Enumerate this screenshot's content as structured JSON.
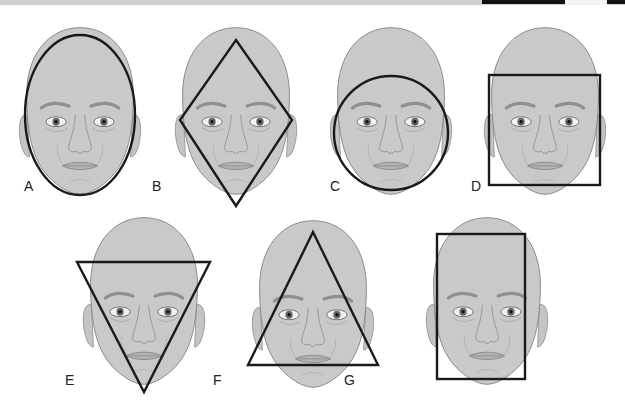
{
  "figure": {
    "background": "#ffffff",
    "skin_color": "#c9c9c9",
    "outline_color": "#1a1a1a",
    "panels": [
      {
        "label": "A",
        "shape": "oval"
      },
      {
        "label": "B",
        "shape": "diamond"
      },
      {
        "label": "C",
        "shape": "round"
      },
      {
        "label": "D",
        "shape": "square"
      },
      {
        "label": "E",
        "shape": "inverted-triangle"
      },
      {
        "label": "F",
        "shape": "triangle"
      },
      {
        "label": "G",
        "shape": "rectangle"
      }
    ]
  }
}
